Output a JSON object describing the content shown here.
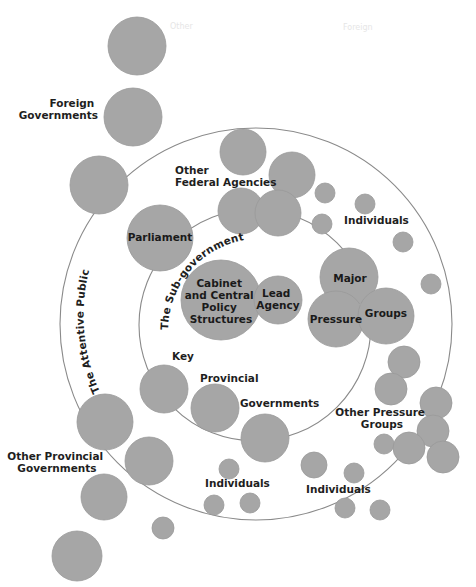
{
  "diagram": {
    "colors": {
      "node": "#a6a6a6",
      "ring": "#8a8a8a",
      "text": "#1e1e1e",
      "background": "#ffffff"
    },
    "rings": {
      "outer": {
        "label": "The Attentive Public"
      },
      "inner": {
        "label": "The Sub-government"
      }
    },
    "core": {
      "cabinet": [
        "Cabinet",
        "and Central",
        "Policy",
        "Structures"
      ],
      "lead_agency": [
        "Lead",
        "Agency"
      ],
      "major_pressure_groups": {
        "major": "Major",
        "pressure": "Pressure",
        "groups": "Groups"
      },
      "parliament": "Parliament"
    },
    "labels": {
      "foreign_governments": [
        "Foreign",
        "Governments"
      ],
      "other_federal_agencies": [
        "Other",
        "Federal Agencies"
      ],
      "individuals_top": "Individuals",
      "key_provincial_governments": {
        "key": "Key",
        "provincial": "Provincial",
        "governments": "Governments"
      },
      "other_pressure_groups": [
        "Other Pressure",
        "Groups"
      ],
      "other_provincial_governments": [
        "Other Provincial",
        "Governments"
      ],
      "individuals_bottom_left": "Individuals",
      "individuals_bottom_right": "Individuals"
    },
    "faint_text": {
      "top_left": "Other",
      "top_right": "Foreign"
    }
  }
}
